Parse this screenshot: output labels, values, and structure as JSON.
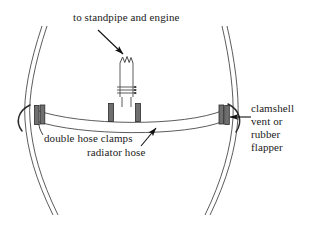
{
  "figure": {
    "background_color": "#ffffff",
    "line_color": "#3a3a3a",
    "clamp_fill_color": "#6d6d6d",
    "text_color": "#1a1a1a"
  },
  "labels": {
    "standpipe": "to standpipe and engine",
    "double_hose_clamps": "double hose clamps",
    "radiator_hose": "radiator hose",
    "clamshell_line1": "clamshell",
    "clamshell_line2": "vent  or",
    "clamshell_line3": "rubber",
    "clamshell_line4": "flapper"
  },
  "parts": [
    {
      "name": "left-tank-wall",
      "kind": "double-line-curve"
    },
    {
      "name": "right-tank-wall",
      "kind": "double-line-curve"
    },
    {
      "name": "radiator-hose",
      "kind": "sagging-band"
    },
    {
      "name": "standpipe",
      "kind": "vertical-pipe-broken-top"
    },
    {
      "name": "left-hose-clamp",
      "kind": "clamp-band"
    },
    {
      "name": "center-left-hose-clamp",
      "kind": "clamp-band"
    },
    {
      "name": "center-right-hose-clamp",
      "kind": "clamp-band"
    },
    {
      "name": "right-hose-clamp",
      "kind": "clamp-band"
    },
    {
      "name": "left-clamshell-flapper",
      "kind": "arc"
    },
    {
      "name": "right-clamshell-flapper",
      "kind": "arc"
    }
  ],
  "leaders": [
    {
      "name": "standpipe-arrow",
      "direction": "down-right"
    },
    {
      "name": "clamshell-arrow",
      "direction": "left"
    },
    {
      "name": "radiator-hose-arrow",
      "direction": "up-right"
    },
    {
      "name": "double-hose-clamps-leader",
      "direction": "up-left"
    }
  ]
}
